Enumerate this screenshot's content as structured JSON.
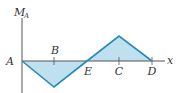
{
  "diagram": {
    "type": "bending-moment-diagram",
    "y_axis_label": "M",
    "y_axis_subscript": "A",
    "x_axis_label": "x",
    "origin_label": "A",
    "point_labels": {
      "B": "B",
      "E": "E",
      "C": "C",
      "D": "D"
    },
    "colors": {
      "fill": "#bfe0ee",
      "outline": "#2a8ab5",
      "axis": "#555555",
      "text": "#333333"
    },
    "segments": [
      {
        "from": "A",
        "to": "B",
        "direction": "negative",
        "note": "moment decreases linearly from 0 at A to minimum below B"
      },
      {
        "from": "B",
        "to": "E",
        "direction": "negative",
        "note": "moment rises linearly back to 0 at E"
      },
      {
        "from": "E",
        "to": "C",
        "direction": "positive",
        "note": "moment rises linearly to maximum at C"
      },
      {
        "from": "C",
        "to": "D",
        "direction": "positive",
        "note": "moment decreases linearly to 0 at D"
      }
    ]
  }
}
